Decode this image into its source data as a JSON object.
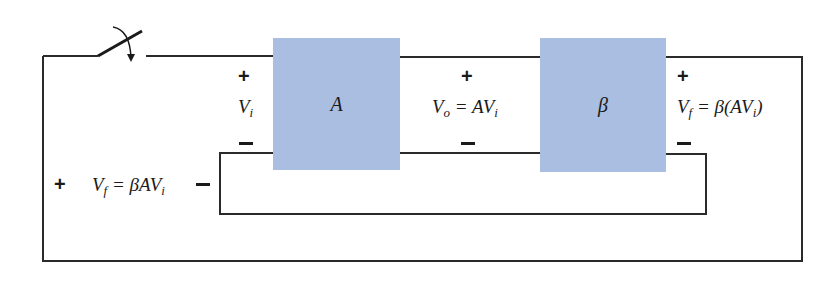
{
  "diagram": {
    "colors": {
      "block_fill": "#a9bee0",
      "wire": "#2a2a2a",
      "background": "#ffffff"
    },
    "blocks": [
      {
        "id": "amplifier",
        "label": "A"
      },
      {
        "id": "feedback",
        "label": "β"
      }
    ],
    "labels": {
      "input": {
        "plus": "+",
        "minus": "−",
        "var": "V",
        "sub": "i"
      },
      "output": {
        "plus": "+",
        "minus": "−",
        "var": "V",
        "sub": "o",
        "eq": " = AV",
        "eq_sub": "i"
      },
      "feedback_out": {
        "plus": "+",
        "minus": "−",
        "var": "V",
        "sub": "f",
        "eq": " = β(AV",
        "eq_sub": "i",
        "eq_tail": ")"
      },
      "loop_return": {
        "plus": "+",
        "minus": "−",
        "var": "V",
        "sub": "f",
        "eq": " = βAV",
        "eq_sub": "i"
      }
    },
    "switch": {
      "state": "open",
      "label": "switch"
    }
  }
}
